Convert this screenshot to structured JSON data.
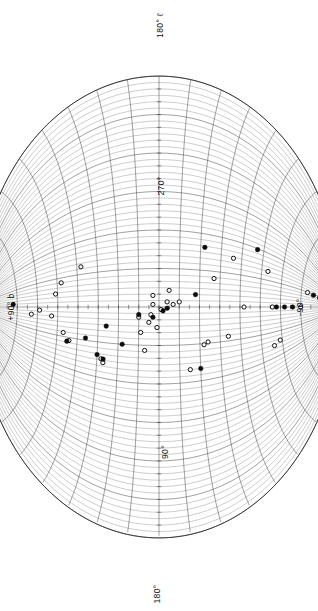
{
  "figure": {
    "name": "galactic-aitoff-map",
    "background": "#ffffff",
    "ink": "#111111"
  },
  "labels": {
    "top": "180° ℓ",
    "left": "+90° b",
    "right": "-90°",
    "bottom": "180°",
    "upper_mid": "270°",
    "lower_mid": "90°"
  },
  "chart_data": {
    "type": "scatter",
    "title": "",
    "subtitle": "",
    "projection": "aitoff",
    "orientation": "portrait-rotated-90",
    "xlabel": "galactic longitude ℓ",
    "ylabel": "galactic latitude b",
    "xlim": [
      0,
      360
    ],
    "ylim": [
      -90,
      90
    ],
    "grid": true,
    "grid_spacing_deg": {
      "longitude": 30,
      "latitude": 10
    },
    "legend": [],
    "tick_labels": {
      "longitude": [
        "180°",
        "270°",
        "90°",
        "180°"
      ],
      "latitude": [
        "+90°",
        "-90°"
      ]
    },
    "series": [
      {
        "name": "filled",
        "marker": "filled-circle",
        "color": "#0d0d0d",
        "size": 4.6,
        "points": [
          {
            "l": 175,
            "b": 72
          },
          {
            "l": 214,
            "b": 45
          },
          {
            "l": 208,
            "b": 36
          },
          {
            "l": 221,
            "b": 30
          },
          {
            "l": 224,
            "b": 27
          },
          {
            "l": 196,
            "b": 26
          },
          {
            "l": 210,
            "b": 18
          },
          {
            "l": 186,
            "b": 10
          },
          {
            "l": 188,
            "b": 3
          },
          {
            "l": 183,
            "b": -2
          },
          {
            "l": 181,
            "b": -4
          },
          {
            "l": 230,
            "b": -20
          },
          {
            "l": 170,
            "b": -18
          },
          {
            "l": 131,
            "b": -22
          },
          {
            "l": 121,
            "b": -47
          },
          {
            "l": 180,
            "b": -58
          },
          {
            "l": 180,
            "b": -62
          },
          {
            "l": 180,
            "b": -66
          },
          {
            "l": 152,
            "b": -76
          }
        ]
      },
      {
        "name": "open",
        "marker": "open-circle",
        "color": "#ffffff",
        "size": 4.2,
        "points": [
          {
            "l": 190,
            "b": 63
          },
          {
            "l": 184,
            "b": 59
          },
          {
            "l": 190,
            "b": 53
          },
          {
            "l": 166,
            "b": 51
          },
          {
            "l": 155,
            "b": 48
          },
          {
            "l": 206,
            "b": 47
          },
          {
            "l": 143,
            "b": 38
          },
          {
            "l": 213,
            "b": 44
          },
          {
            "l": 224,
            "b": 28
          },
          {
            "l": 227,
            "b": 27
          },
          {
            "l": 188,
            "b": 10
          },
          {
            "l": 200,
            "b": 9
          },
          {
            "l": 214,
            "b": 7
          },
          {
            "l": 192,
            "b": 5
          },
          {
            "l": 186,
            "b": 4
          },
          {
            "l": 178,
            "b": 3
          },
          {
            "l": 171,
            "b": 3
          },
          {
            "l": 196,
            "b": 1
          },
          {
            "l": 182,
            "b": -1
          },
          {
            "l": 176,
            "b": -4
          },
          {
            "l": 167,
            "b": -5
          },
          {
            "l": 178,
            "b": -7
          },
          {
            "l": 176,
            "b": -10
          },
          {
            "l": 230,
            "b": -15
          },
          {
            "l": 211,
            "b": -22
          },
          {
            "l": 209,
            "b": -24
          },
          {
            "l": 156,
            "b": -27
          },
          {
            "l": 206,
            "b": -34
          },
          {
            "l": 136,
            "b": -36
          },
          {
            "l": 180,
            "b": -42
          },
          {
            "l": 140,
            "b": -53
          },
          {
            "l": 226,
            "b": -56
          },
          {
            "l": 222,
            "b": -59
          },
          {
            "l": 180,
            "b": -56
          },
          {
            "l": 180,
            "b": -70
          },
          {
            "l": 151,
            "b": -73
          },
          {
            "l": 153,
            "b": -79
          },
          {
            "l": 180,
            "b": -84
          }
        ]
      }
    ],
    "counts": {
      "filled": 19,
      "open": 38,
      "total": 57
    }
  }
}
